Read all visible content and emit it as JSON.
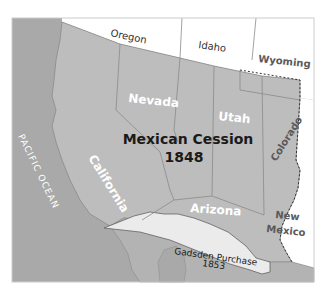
{
  "map": {
    "title": "Mexican Cession",
    "year": "1848",
    "colors": {
      "ocean": "#a9a9a9",
      "cession": "#bdbdbd",
      "outside": "#ffffff",
      "gadsden": "#ebebeb",
      "mexico_land": "#b3b3b3",
      "border": "#8a8a8a",
      "white_text": "#ffffff",
      "dark_text": "#1a1a1a",
      "gray_text": "#5a5a5a"
    },
    "labels": {
      "ocean": "PACIFIC OCEAN",
      "oregon": "Oregon",
      "idaho": "Idaho",
      "wyoming": "Wyoming",
      "nevada": "Nevada",
      "utah": "Utah",
      "california": "California",
      "colorado": "Colorado",
      "arizona": "Arizona",
      "new_mexico_line1": "New",
      "new_mexico_line2": "Mexico",
      "gadsden_line1": "Gadsden Purchase",
      "gadsden_line2": "1853"
    }
  }
}
